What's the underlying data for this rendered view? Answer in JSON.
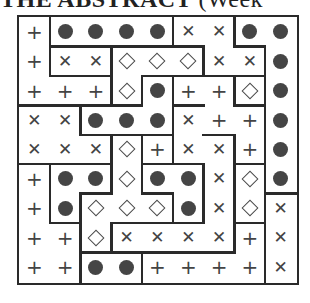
{
  "title": {
    "bold": "THE ABSTRACT",
    "light": " (Week"
  },
  "puzzle": {
    "rows": 9,
    "cols": 9,
    "symbol_legend": {
      "+": "plus",
      "o": "dot",
      "x": "cross",
      "d": "diamond"
    },
    "grid": [
      [
        "+",
        "o",
        "o",
        "o",
        "o",
        "x",
        "x",
        "o",
        "o"
      ],
      [
        "+",
        "x",
        "x",
        "d",
        "d",
        "d",
        "x",
        "x",
        "o"
      ],
      [
        "+",
        "+",
        "+",
        "d",
        "o",
        "+",
        "+",
        "d",
        "o"
      ],
      [
        "x",
        "x",
        "o",
        "o",
        "o",
        "x",
        "+",
        "+",
        "o"
      ],
      [
        "x",
        "x",
        "x",
        "d",
        "+",
        "x",
        "x",
        "+",
        "o"
      ],
      [
        "+",
        "o",
        "o",
        "d",
        "o",
        "o",
        "x",
        "d",
        "o"
      ],
      [
        "+",
        "o",
        "d",
        "d",
        "d",
        "o",
        "x",
        "d",
        "x"
      ],
      [
        "+",
        "+",
        "d",
        "x",
        "x",
        "x",
        "x",
        "+",
        "x"
      ],
      [
        "+",
        "+",
        "o",
        "o",
        "+",
        "+",
        "+",
        "+",
        "x"
      ]
    ],
    "walls_top": [
      [
        0,
        0,
        0,
        0,
        0,
        0,
        0,
        0,
        0
      ],
      [
        0,
        1,
        1,
        1,
        1,
        1,
        0,
        1,
        0
      ],
      [
        0,
        1,
        1,
        0,
        1,
        1,
        1,
        1,
        0
      ],
      [
        1,
        1,
        1,
        1,
        0,
        1,
        0,
        1,
        0
      ],
      [
        0,
        0,
        1,
        1,
        1,
        0,
        1,
        0,
        0
      ],
      [
        1,
        1,
        1,
        0,
        1,
        1,
        0,
        1,
        0
      ],
      [
        0,
        0,
        1,
        0,
        1,
        0,
        0,
        0,
        1
      ],
      [
        0,
        1,
        0,
        1,
        1,
        1,
        0,
        1,
        0
      ],
      [
        0,
        0,
        1,
        1,
        1,
        1,
        1,
        0,
        0
      ]
    ],
    "walls_left": [
      [
        0,
        1,
        0,
        0,
        0,
        1,
        0,
        1,
        0
      ],
      [
        0,
        1,
        0,
        1,
        0,
        0,
        1,
        0,
        1
      ],
      [
        0,
        0,
        0,
        1,
        1,
        1,
        0,
        1,
        1
      ],
      [
        0,
        0,
        1,
        0,
        0,
        1,
        0,
        0,
        1
      ],
      [
        0,
        0,
        0,
        1,
        1,
        1,
        0,
        1,
        1
      ],
      [
        0,
        1,
        0,
        1,
        1,
        0,
        1,
        1,
        1
      ],
      [
        0,
        1,
        1,
        0,
        0,
        1,
        1,
        1,
        1
      ],
      [
        0,
        0,
        1,
        1,
        0,
        0,
        0,
        1,
        1
      ],
      [
        0,
        0,
        1,
        0,
        1,
        0,
        0,
        0,
        1
      ]
    ]
  }
}
